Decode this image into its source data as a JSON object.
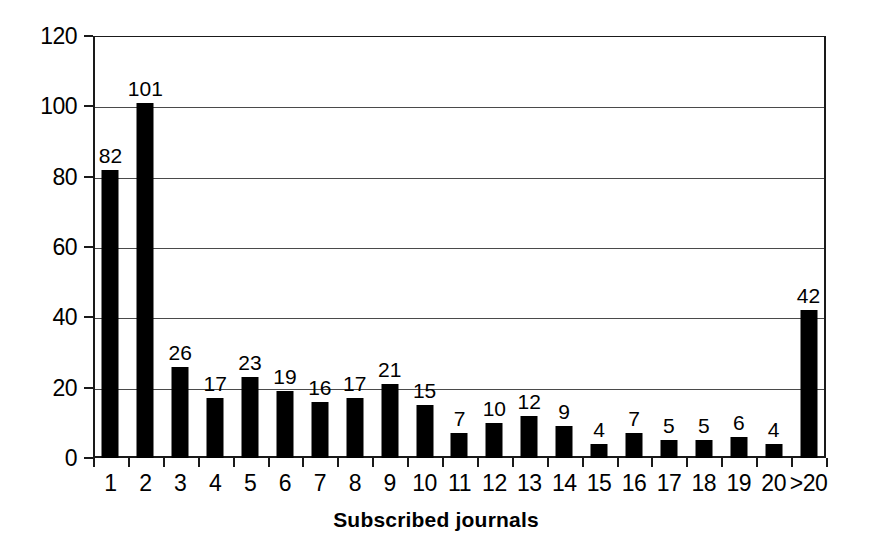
{
  "chart_data": {
    "type": "bar",
    "title": "",
    "xlabel": "Subscribed journals",
    "ylabel": "",
    "categories": [
      "1",
      "2",
      "3",
      "4",
      "5",
      "6",
      "7",
      "8",
      "9",
      "10",
      "11",
      "12",
      "13",
      "14",
      "15",
      "16",
      "17",
      "18",
      "19",
      "20",
      ">20"
    ],
    "values": [
      82,
      101,
      26,
      17,
      23,
      19,
      16,
      17,
      21,
      15,
      7,
      10,
      12,
      9,
      4,
      7,
      5,
      5,
      6,
      4,
      42
    ],
    "ylim": [
      0,
      120
    ],
    "y_ticks": [
      0,
      20,
      40,
      60,
      80,
      100,
      120
    ],
    "grid": "horizontal",
    "legend": "none",
    "bar_color": "#000000",
    "axis_color": "#1a1a1a",
    "gridline_color": "#4a4a4a",
    "data_labels_shown": true
  },
  "figure": {
    "background": "#ffffff"
  }
}
